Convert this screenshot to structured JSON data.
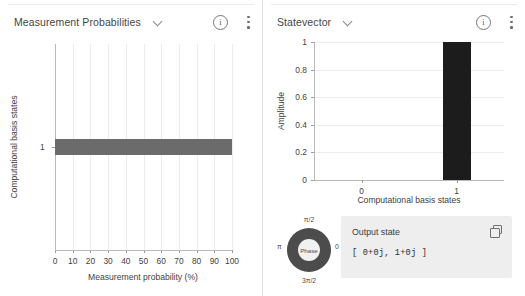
{
  "panels": {
    "left": {
      "title": "Measurement Probabilities",
      "dropdown_icon": "chevron-down-icon",
      "info_icon": "i",
      "menu_icon": "kebab-menu-icon"
    },
    "right": {
      "title": "Statevector",
      "dropdown_icon": "chevron-down-icon",
      "info_icon": "i",
      "menu_icon": "kebab-menu-icon"
    }
  },
  "phase_wheel": {
    "center_label": "Phase",
    "labels": {
      "top": "π/2",
      "right": "0",
      "bottom": "3π/2",
      "left": "π"
    },
    "ring_color": "#4c4c4c"
  },
  "output_state": {
    "title": "Output state",
    "value": "[ 0+0j, 1+0j ]",
    "copy_icon": "copy-icon"
  },
  "chart_data": [
    {
      "type": "bar",
      "orientation": "horizontal",
      "title": "Measurement Probabilities",
      "xlabel": "Measurement probability (%)",
      "ylabel": "Computational basis states",
      "categories": [
        "1"
      ],
      "values": [
        100
      ],
      "xlim": [
        0,
        100
      ],
      "xticks": [
        0,
        10,
        20,
        30,
        40,
        50,
        60,
        70,
        80,
        90,
        100
      ],
      "xtick_labels": [
        "0",
        "10",
        "20",
        "30",
        "40",
        "50",
        "60",
        "70",
        "80",
        "90",
        "100"
      ],
      "ytick_labels": [
        "1"
      ],
      "grid": "vertical",
      "bar_color": "#6b6b6b"
    },
    {
      "type": "bar",
      "orientation": "vertical",
      "title": "Statevector",
      "xlabel": "Computational basis states",
      "ylabel": "Amplitude",
      "categories": [
        "0",
        "1"
      ],
      "values": [
        0,
        1
      ],
      "ylim": [
        0,
        1
      ],
      "yticks": [
        0,
        0.2,
        0.4,
        0.6,
        0.8,
        1
      ],
      "ytick_labels": [
        "0",
        "0.2",
        "0.4",
        "0.6",
        "0.8",
        "1"
      ],
      "xtick_labels": [
        "0",
        "1"
      ],
      "grid": "horizontal",
      "bar_color": "#1c1c1c"
    }
  ]
}
